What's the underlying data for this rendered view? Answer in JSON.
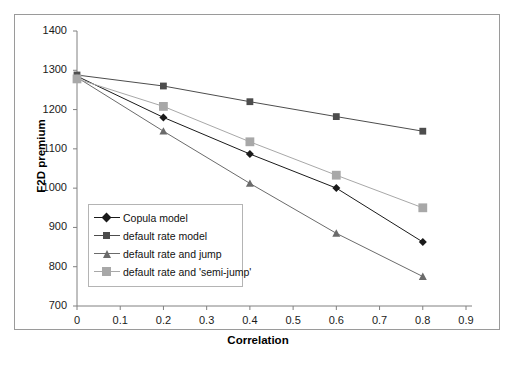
{
  "chart_data": {
    "type": "line",
    "title": "",
    "xlabel": "Correlation",
    "ylabel": "F2D premium",
    "x": [
      0,
      0.2,
      0.4,
      0.6,
      0.8
    ],
    "xlim": [
      0,
      0.9
    ],
    "ylim": [
      700,
      1400
    ],
    "xticks": [
      "0",
      "0.1",
      "0.2",
      "0.3",
      "0.4",
      "0.5",
      "0.6",
      "0.7",
      "0.8",
      "0.9"
    ],
    "yticks": [
      "700",
      "800",
      "900",
      "1000",
      "1100",
      "1200",
      "1300",
      "1400"
    ],
    "grid": false,
    "legend_position": "inside-lower-left",
    "series": [
      {
        "name": "Copula model",
        "marker": "diamond",
        "color": "#1a1a1a",
        "values": [
          1285,
          1180,
          1087,
          1000,
          863
        ]
      },
      {
        "name": "default rate model",
        "marker": "square",
        "color": "#4d4d4d",
        "values": [
          1288,
          1260,
          1220,
          1182,
          1145
        ]
      },
      {
        "name": "default rate and jump",
        "marker": "triangle",
        "color": "#6b6b6b",
        "values": [
          1282,
          1145,
          1012,
          885,
          775
        ]
      },
      {
        "name": "default rate and 'semi-jump'",
        "marker": "square",
        "color": "#a8a8a8",
        "values": [
          1278,
          1208,
          1118,
          1033,
          950
        ]
      }
    ]
  },
  "axes": {
    "y_title": "F2D premium",
    "x_title": "Correlation",
    "y_tick_labels": [
      "1400",
      "1300",
      "1200",
      "1100",
      "1000",
      "900",
      "800",
      "700"
    ],
    "x_tick_labels": [
      "0",
      "0.1",
      "0.2",
      "0.3",
      "0.4",
      "0.5",
      "0.6",
      "0.7",
      "0.8",
      "0.9"
    ]
  },
  "legend": {
    "entries": [
      {
        "label": "Copula model"
      },
      {
        "label": "default rate model"
      },
      {
        "label": "default rate and jump"
      },
      {
        "label": "default rate and 'semi-jump'"
      }
    ]
  },
  "colors": {
    "series_1": "#1a1a1a",
    "series_2": "#4d4d4d",
    "series_3": "#6b6b6b",
    "series_4": "#a8a8a8",
    "axis": "#808080",
    "frame": "#9a9a9a",
    "background": "#ffffff"
  }
}
